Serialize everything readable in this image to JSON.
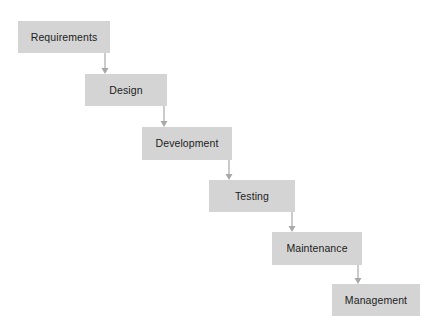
{
  "diagram": {
    "type": "flowchart",
    "orientation": "top-left-to-bottom-right-cascade",
    "background_color": "#ffffff",
    "box_fill_color": "#d4d4d4",
    "box_text_color": "#1c1c1c",
    "connector_color": "#a8a8a8",
    "stages": [
      {
        "id": "requirements",
        "label": "Requirements",
        "order": 1,
        "x": 18,
        "y": 21,
        "width": 92,
        "height": 32
      },
      {
        "id": "design",
        "label": "Design",
        "order": 2,
        "x": 85,
        "y": 74,
        "width": 82,
        "height": 32
      },
      {
        "id": "development",
        "label": "Development",
        "order": 3,
        "x": 142,
        "y": 127,
        "width": 90,
        "height": 33
      },
      {
        "id": "testing",
        "label": "Testing",
        "order": 4,
        "x": 209,
        "y": 180,
        "width": 86,
        "height": 32
      },
      {
        "id": "maintenance",
        "label": "Maintenance",
        "order": 5,
        "x": 272,
        "y": 232,
        "width": 90,
        "height": 33
      },
      {
        "id": "management",
        "label": "Management",
        "order": 6,
        "x": 332,
        "y": 284,
        "width": 88,
        "height": 32
      }
    ],
    "connectors": [
      {
        "id": "requirements-to-design",
        "from": "requirements",
        "to": "design",
        "x": 105,
        "y_start": 53,
        "y_end": 74
      },
      {
        "id": "design-to-development",
        "from": "design",
        "to": "development",
        "x": 164,
        "y_start": 106,
        "y_end": 127
      },
      {
        "id": "development-to-testing",
        "from": "development",
        "to": "testing",
        "x": 229,
        "y_start": 160,
        "y_end": 180
      },
      {
        "id": "testing-to-maintenance",
        "from": "testing",
        "to": "maintenance",
        "x": 292,
        "y_start": 212,
        "y_end": 232
      },
      {
        "id": "maintenance-to-management",
        "from": "maintenance",
        "to": "management",
        "x": 358,
        "y_start": 265,
        "y_end": 284
      }
    ]
  }
}
